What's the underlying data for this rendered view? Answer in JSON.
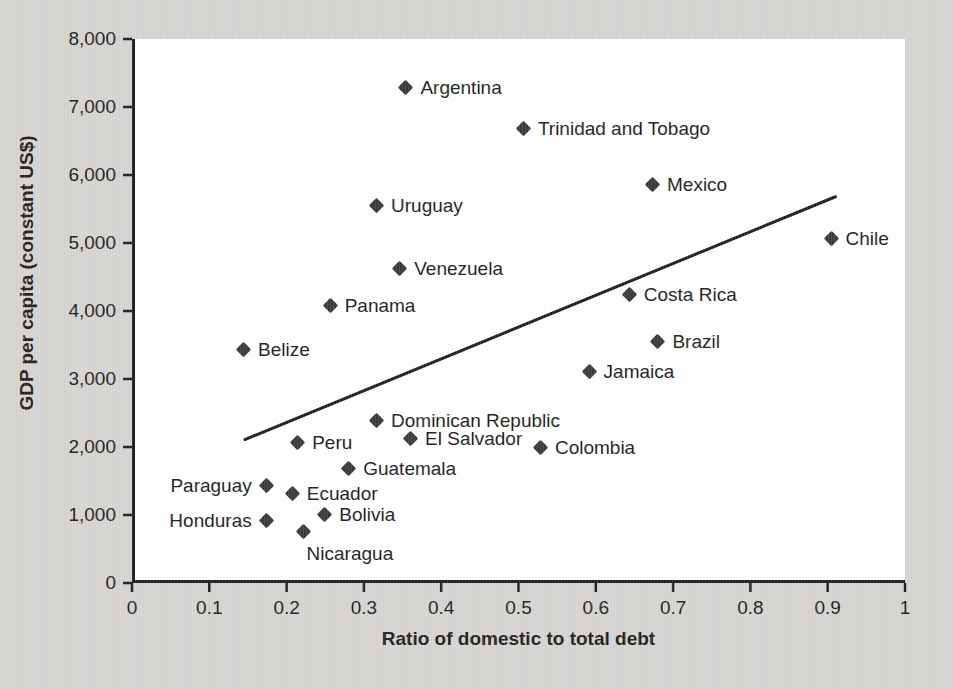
{
  "chart_data": {
    "type": "scatter",
    "title": "",
    "xlabel": "Ratio of domestic to total debt",
    "ylabel": "GDP per capita (constant US$)",
    "xlim": [
      0,
      1
    ],
    "ylim": [
      0,
      8000
    ],
    "grid": false,
    "legend": "none",
    "x_ticks": [
      "0",
      "0.1",
      "0.2",
      "0.3",
      "0.4",
      "0.5",
      "0.6",
      "0.7",
      "0.8",
      "0.9",
      "1"
    ],
    "x_tick_values": [
      0,
      0.1,
      0.2,
      0.3,
      0.4,
      0.5,
      0.6,
      0.7,
      0.8,
      0.9,
      1
    ],
    "y_ticks": [
      "0",
      "1,000",
      "2,000",
      "3,000",
      "4,000",
      "5,000",
      "6,000",
      "7,000",
      "8,000"
    ],
    "y_tick_values": [
      0,
      1000,
      2000,
      3000,
      4000,
      5000,
      6000,
      7000,
      8000
    ],
    "marker_color": "#3b3a3c",
    "marker_shape": "diamond",
    "points": [
      {
        "label": "Argentina",
        "x": 0.355,
        "y": 7300,
        "label_pos": "right"
      },
      {
        "label": "Trinidad and Tobago",
        "x": 0.507,
        "y": 6700,
        "label_pos": "right"
      },
      {
        "label": "Mexico",
        "x": 0.674,
        "y": 5870,
        "label_pos": "right"
      },
      {
        "label": "Uruguay",
        "x": 0.317,
        "y": 5560,
        "label_pos": "right"
      },
      {
        "label": "Chile",
        "x": 0.905,
        "y": 5080,
        "label_pos": "right"
      },
      {
        "label": "Venezuela",
        "x": 0.347,
        "y": 4640,
        "label_pos": "right"
      },
      {
        "label": "Costa Rica",
        "x": 0.644,
        "y": 4250,
        "label_pos": "right"
      },
      {
        "label": "Panama",
        "x": 0.257,
        "y": 4090,
        "label_pos": "right"
      },
      {
        "label": "Brazil",
        "x": 0.681,
        "y": 3570,
        "label_pos": "right"
      },
      {
        "label": "Belize",
        "x": 0.145,
        "y": 3450,
        "label_pos": "right"
      },
      {
        "label": "Jamaica",
        "x": 0.592,
        "y": 3130,
        "label_pos": "right"
      },
      {
        "label": "Dominican Republic",
        "x": 0.317,
        "y": 2400,
        "label_pos": "right"
      },
      {
        "label": "El Salvador",
        "x": 0.361,
        "y": 2140,
        "label_pos": "right"
      },
      {
        "label": "Peru",
        "x": 0.215,
        "y": 2080,
        "label_pos": "right"
      },
      {
        "label": "Colombia",
        "x": 0.529,
        "y": 2000,
        "label_pos": "right"
      },
      {
        "label": "Guatemala",
        "x": 0.281,
        "y": 1700,
        "label_pos": "right"
      },
      {
        "label": "Paraguay",
        "x": 0.173,
        "y": 1450,
        "label_pos": "left"
      },
      {
        "label": "Ecuador",
        "x": 0.208,
        "y": 1330,
        "label_pos": "right"
      },
      {
        "label": "Bolivia",
        "x": 0.25,
        "y": 1020,
        "label_pos": "right"
      },
      {
        "label": "Honduras",
        "x": 0.173,
        "y": 940,
        "label_pos": "left"
      },
      {
        "label": "Nicaragua",
        "x": 0.222,
        "y": 780,
        "label_pos": "below"
      }
    ],
    "trendline": {
      "type": "linear",
      "x_start": 0.146,
      "y_start": 2110,
      "x_end": 0.91,
      "y_end": 5680,
      "color": "#231f20"
    }
  }
}
